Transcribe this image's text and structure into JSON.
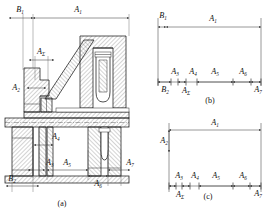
{
  "figure": {
    "background_color": "#ffffff",
    "line_color": "#1a1a1a"
  },
  "captions": {
    "a": "(a)",
    "b": "(b)",
    "c": "(c)"
  },
  "view_a": {
    "name": "assembly-cross-section",
    "dimensions": [
      {
        "id": "a-B1",
        "base": "B",
        "sub": "1"
      },
      {
        "id": "a-A1",
        "base": "A",
        "sub": "1"
      },
      {
        "id": "a-ASigma",
        "base": "A",
        "sub": "Σ"
      },
      {
        "id": "a-A2",
        "base": "A",
        "sub": "2"
      },
      {
        "id": "a-A4",
        "base": "A",
        "sub": "4"
      },
      {
        "id": "a-A3",
        "base": "A",
        "sub": "3"
      },
      {
        "id": "a-A5",
        "base": "A",
        "sub": "5"
      },
      {
        "id": "a-A6",
        "base": "A",
        "sub": "6"
      },
      {
        "id": "a-A7",
        "base": "A",
        "sub": "7"
      },
      {
        "id": "a-B2",
        "base": "B",
        "sub": "2"
      }
    ]
  },
  "view_b": {
    "name": "dimension-chain-b",
    "top_labels": [
      {
        "id": "b-B1",
        "base": "B",
        "sub": "1"
      },
      {
        "id": "b-A1",
        "base": "A",
        "sub": "1"
      }
    ],
    "mid_labels": [
      {
        "id": "b-A3",
        "base": "A",
        "sub": "3"
      },
      {
        "id": "b-A4",
        "base": "A",
        "sub": "4"
      },
      {
        "id": "b-A5",
        "base": "A",
        "sub": "5"
      },
      {
        "id": "b-A6",
        "base": "A",
        "sub": "6"
      }
    ],
    "bottom_labels": [
      {
        "id": "b-B2",
        "base": "B",
        "sub": "2"
      },
      {
        "id": "b-ASigma",
        "base": "A",
        "sub": "Σ"
      },
      {
        "id": "b-A7",
        "base": "A",
        "sub": "7"
      }
    ]
  },
  "view_c": {
    "name": "dimension-chain-c",
    "top_labels": [
      {
        "id": "c-A1",
        "base": "A",
        "sub": "1"
      }
    ],
    "left_labels": [
      {
        "id": "c-A2",
        "base": "A",
        "sub": "2"
      }
    ],
    "mid_labels": [
      {
        "id": "c-A3",
        "base": "A",
        "sub": "3"
      },
      {
        "id": "c-A4",
        "base": "A",
        "sub": "4"
      },
      {
        "id": "c-A5",
        "base": "A",
        "sub": "5"
      },
      {
        "id": "c-A6",
        "base": "A",
        "sub": "6"
      }
    ],
    "bottom_labels": [
      {
        "id": "c-ASigma",
        "base": "A",
        "sub": "Σ"
      },
      {
        "id": "c-A7",
        "base": "A",
        "sub": "7"
      }
    ]
  }
}
